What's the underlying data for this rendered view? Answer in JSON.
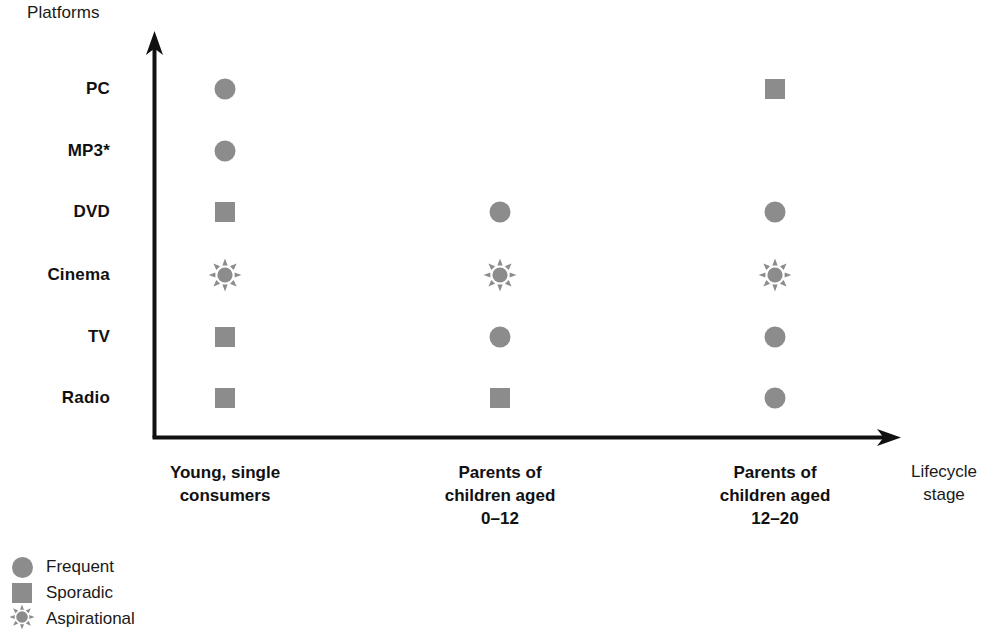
{
  "chart_data": {
    "type": "scatter",
    "title": "",
    "xlabel": "Lifecycle stage",
    "ylabel": "Platforms",
    "grid": false,
    "legend_position": "bottom-left",
    "categories": [
      "Young, single consumers",
      "Parents of children aged 0–12",
      "Parents of children aged 12–20"
    ],
    "platforms": [
      "PC",
      "MP3*",
      "DVD",
      "Cinema",
      "TV",
      "Radio"
    ],
    "marker_types": [
      "frequent",
      "sporadic",
      "aspirational"
    ],
    "points": [
      {
        "platform": "PC",
        "category": "Young, single consumers",
        "usage": "frequent"
      },
      {
        "platform": "MP3*",
        "category": "Young, single consumers",
        "usage": "frequent"
      },
      {
        "platform": "DVD",
        "category": "Young, single consumers",
        "usage": "sporadic"
      },
      {
        "platform": "Cinema",
        "category": "Young, single consumers",
        "usage": "aspirational"
      },
      {
        "platform": "TV",
        "category": "Young, single consumers",
        "usage": "sporadic"
      },
      {
        "platform": "Radio",
        "category": "Young, single consumers",
        "usage": "sporadic"
      },
      {
        "platform": "DVD",
        "category": "Parents of children aged 0–12",
        "usage": "frequent"
      },
      {
        "platform": "Cinema",
        "category": "Parents of children aged 0–12",
        "usage": "aspirational"
      },
      {
        "platform": "TV",
        "category": "Parents of children aged 0–12",
        "usage": "frequent"
      },
      {
        "platform": "Radio",
        "category": "Parents of children aged 0–12",
        "usage": "sporadic"
      },
      {
        "platform": "PC",
        "category": "Parents of children aged 12–20",
        "usage": "sporadic"
      },
      {
        "platform": "DVD",
        "category": "Parents of children aged 12–20",
        "usage": "frequent"
      },
      {
        "platform": "Cinema",
        "category": "Parents of children aged 12–20",
        "usage": "aspirational"
      },
      {
        "platform": "TV",
        "category": "Parents of children aged 12–20",
        "usage": "frequent"
      },
      {
        "platform": "Radio",
        "category": "Parents of children aged 12–20",
        "usage": "frequent"
      }
    ],
    "legend": [
      {
        "label": "Frequent",
        "marker": "circle"
      },
      {
        "label": "Sporadic",
        "marker": "square"
      },
      {
        "label": "Aspirational",
        "marker": "sun"
      }
    ],
    "colors": {
      "marker": "#8c8c8c",
      "axis": "#111111",
      "text": "#1a1a1a"
    }
  },
  "axes": {
    "y_title": "Platforms",
    "x_title_line1": "Lifecycle",
    "x_title_line2": "stage"
  },
  "y_ticks": [
    {
      "label": "PC"
    },
    {
      "label": "MP3*"
    },
    {
      "label": "DVD"
    },
    {
      "label": "Cinema"
    },
    {
      "label": "TV"
    },
    {
      "label": "Radio"
    }
  ],
  "x_ticks": [
    {
      "line1": "Young, single",
      "line2": "consumers",
      "line3": ""
    },
    {
      "line1": "Parents of",
      "line2": "children aged",
      "line3": "0–12"
    },
    {
      "line1": "Parents of",
      "line2": "children aged",
      "line3": "12–20"
    }
  ],
  "legend": {
    "items": [
      {
        "label": "Frequent"
      },
      {
        "label": "Sporadic"
      },
      {
        "label": "Aspirational"
      }
    ]
  }
}
